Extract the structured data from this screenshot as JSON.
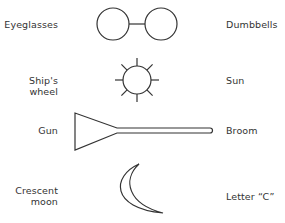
{
  "rows": [
    {
      "left_label": "Eyeglasses",
      "shape": "eyeglasses-dumbbell",
      "right_label": "Dumbbells"
    },
    {
      "left_label": "Ship's wheel",
      "shape": "circle-with-spokes",
      "right_label": "Sun"
    },
    {
      "left_label": "Gun",
      "shape": "broom-gun",
      "right_label": "Broom"
    },
    {
      "left_label_line1": "Crescent",
      "left_label_line2": "moon",
      "shape": "crescent",
      "right_label": "Letter “C”"
    }
  ],
  "colors": {
    "stroke": "#333333",
    "text": "#333333",
    "background": "#ffffff"
  }
}
